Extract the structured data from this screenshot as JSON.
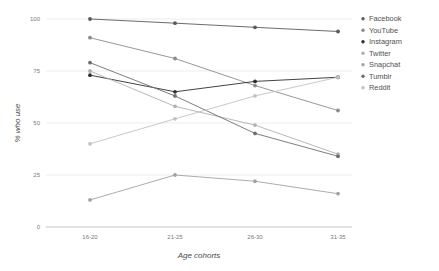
{
  "chart_data": {
    "type": "line",
    "title": "",
    "xlabel": "Age cohorts",
    "ylabel": "% who use",
    "categories": [
      "16-20",
      "21-25",
      "26-30",
      "31-35"
    ],
    "ylim": [
      0,
      100
    ],
    "yticks": [
      0,
      25,
      50,
      75,
      100
    ],
    "grid": true,
    "legend_position": "right",
    "series": [
      {
        "name": "Facebook",
        "color": "#5a5a5a",
        "values": [
          100,
          98,
          96,
          94
        ]
      },
      {
        "name": "YouTube",
        "color": "#8c8c8c",
        "values": [
          91,
          81,
          68,
          56
        ]
      },
      {
        "name": "Instagram",
        "color": "#2e2e2e",
        "values": [
          73,
          65,
          70,
          72
        ]
      },
      {
        "name": "Twitter",
        "color": "#b0b0b0",
        "values": [
          75,
          58,
          49,
          35
        ]
      },
      {
        "name": "Snapchat",
        "color": "#a3a3a3",
        "values": [
          13,
          25,
          22,
          16
        ]
      },
      {
        "name": "Tumblr",
        "color": "#6e6e6e",
        "values": [
          79,
          63,
          45,
          34
        ]
      },
      {
        "name": "Reddit",
        "color": "#c2c2c2",
        "values": [
          40,
          52,
          63,
          72
        ]
      }
    ]
  },
  "axis": {
    "y_label": "% who use",
    "x_label": "Age cohorts",
    "y_tick_labels": [
      "0",
      "25",
      "50",
      "75",
      "100"
    ],
    "x_tick_labels": [
      "16-20",
      "21-25",
      "26-30",
      "31-35"
    ]
  },
  "legend": {
    "items": [
      {
        "label": "Facebook"
      },
      {
        "label": "YouTube"
      },
      {
        "label": "Instagram"
      },
      {
        "label": "Twitter"
      },
      {
        "label": "Snapchat"
      },
      {
        "label": "Tumblr"
      },
      {
        "label": "Reddit"
      }
    ]
  }
}
